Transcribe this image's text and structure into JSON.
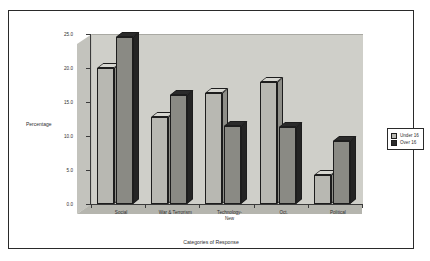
{
  "chart_data": {
    "type": "bar",
    "title": "",
    "subtitle": "",
    "xlabel": "Categories of Response",
    "ylabel": "Percentage",
    "ylim": [
      0,
      25
    ],
    "yticks": [
      "0.0",
      "5.0",
      "10.0",
      "15.0",
      "20.0",
      "25.0"
    ],
    "ytick_values": [
      0,
      5,
      10,
      15,
      20,
      25
    ],
    "grid": false,
    "legend_position": "right",
    "categories": [
      "Social",
      "War & Terrorism",
      "Technology-\nNew",
      "Oct.",
      "Political"
    ],
    "series": [
      {
        "name": "Under 16",
        "color": "#b8b8b2",
        "values": [
          20.0,
          12.8,
          16.3,
          18.0,
          4.3
        ]
      },
      {
        "name": "Over 16",
        "color": "#2b2b2b",
        "values": [
          24.5,
          16.0,
          11.5,
          11.3,
          9.3
        ]
      }
    ]
  },
  "legend": {
    "items": [
      {
        "label": "Under 16"
      },
      {
        "label": "Over 16"
      }
    ]
  }
}
